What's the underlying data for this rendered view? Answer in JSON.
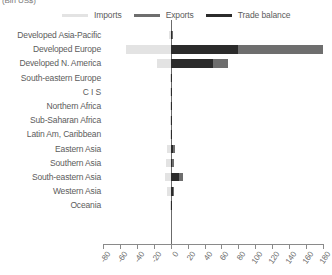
{
  "units_caption": "(Bln US$)",
  "legend": {
    "position": "top",
    "items": [
      {
        "label": "Imports",
        "color": "#e3e3e3",
        "icon": "line-swatch-icon"
      },
      {
        "label": "Exports",
        "color": "#6e6e6e",
        "icon": "line-swatch-icon"
      },
      {
        "label": "Trade balance",
        "color": "#2b2b2b",
        "icon": "line-swatch-icon"
      }
    ]
  },
  "chart_data": {
    "type": "bar",
    "orientation": "horizontal",
    "title": "",
    "subtitle": "",
    "xlabel": "(Bln US$)",
    "ylabel": "",
    "xlim": [
      -80,
      180
    ],
    "xticks": [
      -80,
      -60,
      -40,
      -20,
      0,
      20,
      40,
      60,
      80,
      100,
      120,
      140,
      160,
      180
    ],
    "xtick_labels": [
      "-80",
      "-60",
      "-40",
      "-20",
      "0",
      "20",
      "40",
      "60",
      "80",
      "100",
      "120",
      "140",
      "160",
      "180"
    ],
    "grid": false,
    "zero_line": 0,
    "categories": [
      "Developed Asia-Pacific",
      "Developed Europe",
      "Developed N. America",
      "South-eastern Europe",
      "C I S",
      "Northern Africa",
      "Sub-Saharan Africa",
      "Latin Am, Caribbean",
      "Eastern Asia",
      "Southern Asia",
      "South-eastern Asia",
      "Western Asia",
      "Oceania"
    ],
    "series": [
      {
        "name": "Imports",
        "color": "#e3e3e3",
        "values": [
          -2,
          -53,
          -16,
          -1,
          -1,
          -0.5,
          -0.5,
          -1,
          -4,
          -5,
          -7,
          -4,
          -0.5
        ]
      },
      {
        "name": "Exports",
        "color": "#6e6e6e",
        "values": [
          3,
          180,
          68,
          1,
          1,
          0.5,
          0.5,
          1,
          5,
          4,
          14,
          4,
          0.5
        ]
      },
      {
        "name": "Trade balance",
        "color": "#2b2b2b",
        "values": [
          2,
          80,
          50,
          0.5,
          0.5,
          0.4,
          0.4,
          0.6,
          3,
          2,
          10,
          3,
          0.4
        ]
      }
    ]
  }
}
